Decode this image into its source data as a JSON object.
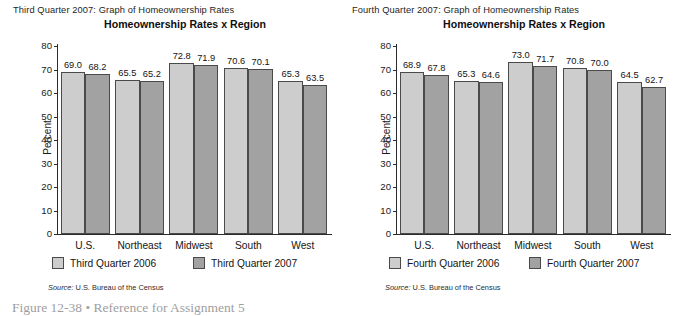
{
  "page": {
    "figure_caption": "Figure 12-38 • Reference for Assignment 5"
  },
  "panels": [
    {
      "heading": "Third Quarter 2007: Graph of Homeownership Rates",
      "title": "Homeownership Rates x Region",
      "ylabel": "Percent",
      "source_word": "Source:",
      "source_text": "U.S. Bureau of the Census",
      "legend": [
        {
          "label": "Third Quarter 2006",
          "swatch": "light",
          "color": "#cdcdcd"
        },
        {
          "label": "Third Quarter 2007",
          "swatch": "dark",
          "color": "#a2a2a2"
        }
      ]
    },
    {
      "heading": "Fourth Quarter 2007: Graph of Homeownership Rates",
      "title": "Homeownership Rates x Region",
      "ylabel": "Percent",
      "source_word": "Source:",
      "source_text": "U.S. Bureau of the Census",
      "legend": [
        {
          "label": "Fourth Quarter 2006",
          "swatch": "light",
          "color": "#cdcdcd"
        },
        {
          "label": "Fourth Quarter 2007",
          "swatch": "dark",
          "color": "#a2a2a2"
        }
      ]
    }
  ],
  "chart_data": [
    {
      "type": "bar",
      "title": "Homeownership Rates x Region",
      "subtitle": "Third Quarter 2007: Graph of Homeownership Rates",
      "xlabel": "",
      "ylabel": "Percent",
      "ylim": [
        0,
        80
      ],
      "yticks": [
        0,
        10,
        20,
        30,
        40,
        50,
        60,
        70,
        80
      ],
      "grid": false,
      "legend_position": "bottom",
      "categories": [
        "U.S.",
        "Northeast",
        "Midwest",
        "South",
        "West"
      ],
      "series": [
        {
          "name": "Third Quarter 2006",
          "color": "#cdcdcd",
          "values": [
            69.0,
            65.5,
            72.8,
            70.6,
            65.3
          ]
        },
        {
          "name": "Third Quarter 2007",
          "color": "#a2a2a2",
          "values": [
            68.2,
            65.2,
            71.9,
            70.1,
            63.5
          ]
        }
      ],
      "source": "Source: U.S. Bureau of the Census"
    },
    {
      "type": "bar",
      "title": "Homeownership Rates x Region",
      "subtitle": "Fourth Quarter 2007: Graph of Homeownership Rates",
      "xlabel": "",
      "ylabel": "Percent",
      "ylim": [
        0,
        80
      ],
      "yticks": [
        0,
        10,
        20,
        30,
        40,
        50,
        60,
        70,
        80
      ],
      "grid": false,
      "legend_position": "bottom",
      "categories": [
        "U.S.",
        "Northeast",
        "Midwest",
        "South",
        "West"
      ],
      "series": [
        {
          "name": "Fourth Quarter 2006",
          "color": "#cdcdcd",
          "values": [
            68.9,
            65.3,
            73.0,
            70.8,
            64.5
          ]
        },
        {
          "name": "Fourth Quarter 2007",
          "color": "#a2a2a2",
          "values": [
            67.8,
            64.6,
            71.7,
            70.0,
            62.7
          ]
        }
      ],
      "source": "Source: U.S. Bureau of the Census"
    }
  ]
}
